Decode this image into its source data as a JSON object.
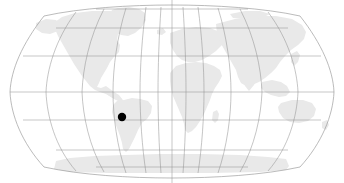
{
  "figure": {
    "kind": "world-locator-map",
    "width": 344,
    "height": 183,
    "background_color": "#ffffff"
  },
  "map": {
    "projection": "robinson",
    "land_color": "#e9e9e9",
    "land_stroke_color": "#e9e9e9",
    "graticule_color": "#8d8d8d",
    "outline_color": "#8d8d8d",
    "graticule_opacity": "0.85",
    "meridian_interval_degrees": 30,
    "parallel_interval_degrees": 30,
    "longitude_range": [
      -180,
      180
    ],
    "latitude_range": [
      -90,
      90
    ],
    "meridian_labels": [
      "180W",
      "150W",
      "120W",
      "90W",
      "60W",
      "30W",
      "0",
      "30E",
      "60E",
      "90E",
      "120E",
      "150E",
      "180E"
    ],
    "parallel_labels": [
      "75N",
      "60N",
      "30N",
      "0",
      "30S",
      "60S",
      "75S"
    ],
    "central_meridian_x": 172,
    "equator_y": 92,
    "continents": [
      "north-america",
      "south-america",
      "africa",
      "europe",
      "asia",
      "australia",
      "antarctica",
      "greenland"
    ]
  },
  "marker": {
    "label": "location-marker",
    "color": "#000000",
    "radius_px": 4.2,
    "x_px": 122,
    "y_px": 117,
    "approx_longitude": -58,
    "approx_latitude": -22,
    "region": "south-america"
  }
}
